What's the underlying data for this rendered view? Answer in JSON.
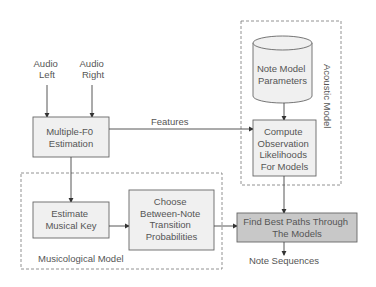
{
  "inputs": {
    "audio_left": [
      "Audio",
      "Left"
    ],
    "audio_right": [
      "Audio",
      "Right"
    ]
  },
  "blocks": {
    "multiple_f0": [
      "Multiple-F0",
      "Estimation"
    ],
    "note_model_params": [
      "Note Model",
      "Parameters"
    ],
    "compute_obs": [
      "Compute",
      "Observation",
      "Likelihoods",
      "For Models"
    ],
    "estimate_key": [
      "Estimate",
      "Musical Key"
    ],
    "choose_transition": [
      "Choose",
      "Between-Note",
      "Transition",
      "Probabilities"
    ],
    "find_paths": [
      "Find Best Paths Through",
      "The Models"
    ]
  },
  "edges": {
    "features_label": "Features",
    "output_label": "Note Sequences"
  },
  "groups": {
    "acoustic_model": "Acoustic Model",
    "musicological_model": "Musicological Model"
  },
  "colors": {
    "box_fill": "#f0f0f0",
    "highlight_fill": "#c8c8c8",
    "stroke": "#666666",
    "text": "#555555"
  }
}
